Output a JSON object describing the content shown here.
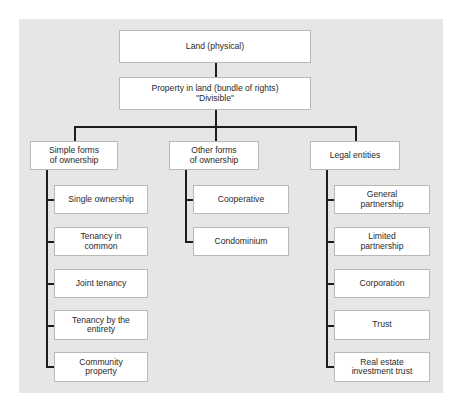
{
  "diagram": {
    "root": {
      "label": "Land (physical)"
    },
    "property": {
      "label": "Property in land (bundle of rights)\n\"Divisible\""
    },
    "branches": [
      {
        "label": "Simple forms\nof ownership",
        "children": [
          "Single ownership",
          "Tenancy in\ncommon",
          "Joint tenancy",
          "Tenancy by the\nentirety",
          "Community\nproperty"
        ]
      },
      {
        "label": "Other forms\nof ownership",
        "children": [
          "Cooperative",
          "Condominium"
        ]
      },
      {
        "label": "Legal entities",
        "children": [
          "General\npartnership",
          "Limited\npartnership",
          "Corporation",
          "Trust",
          "Real estate\ninvestment trust"
        ]
      }
    ]
  },
  "colors": {
    "panel_background": "#e6e6e4",
    "box_fill": "#ffffff",
    "box_border": "#b9b9b9",
    "connector": "#1d1d1d",
    "text": "#2a2a2a"
  }
}
